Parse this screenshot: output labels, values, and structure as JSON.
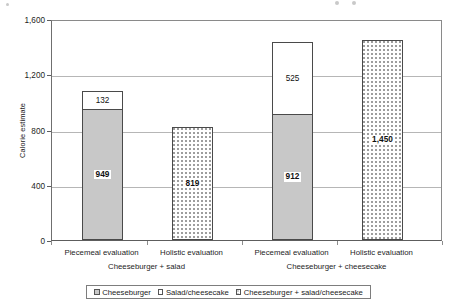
{
  "chart_data": {
    "type": "bar",
    "subtype": "stacked-bar",
    "title": "",
    "xlabel": "",
    "ylabel": "Calorie estimate",
    "ylim": [
      0,
      1600
    ],
    "yticks": [
      0,
      400,
      800,
      1200,
      1600
    ],
    "ytick_labels": [
      "0",
      "400",
      "800",
      "1,200",
      "1,600"
    ],
    "grid": "horizontal",
    "legend_position": "bottom",
    "categories": [
      "Piecemeal evaluation",
      "Holistic evaluation",
      "Piecemeal evaluation",
      "Holistic evaluation"
    ],
    "groups": [
      {
        "label": "Cheeseburger + salad",
        "categories": [
          "Piecemeal evaluation",
          "Holistic evaluation"
        ]
      },
      {
        "label": "Cheeseburger + cheesecake",
        "categories": [
          "Piecemeal evaluation",
          "Holistic evaluation"
        ]
      }
    ],
    "series": [
      {
        "name": "Cheeseburger",
        "fill": "gray",
        "values": [
          949,
          null,
          912,
          null
        ]
      },
      {
        "name": "Salad/cheesecake",
        "fill": "white",
        "values": [
          132,
          null,
          525,
          null
        ]
      },
      {
        "name": "Cheeseburger + salad/cheesecake",
        "fill": "dots",
        "values": [
          null,
          819,
          null,
          1450
        ]
      }
    ],
    "bars": [
      {
        "category": "Piecemeal evaluation",
        "group": "Cheeseburger + salad",
        "total": 1081,
        "segments": [
          {
            "series": "Cheeseburger",
            "value": 949,
            "label": "949",
            "fill": "gray",
            "label_style": "boxed"
          },
          {
            "series": "Salad/cheesecake",
            "value": 132,
            "label": "132",
            "fill": "white",
            "label_style": "plain"
          }
        ]
      },
      {
        "category": "Holistic evaluation",
        "group": "Cheeseburger + salad",
        "total": 819,
        "segments": [
          {
            "series": "Cheeseburger + salad/cheesecake",
            "value": 819,
            "label": "819",
            "fill": "dots",
            "label_style": "boxed"
          }
        ]
      },
      {
        "category": "Piecemeal evaluation",
        "group": "Cheeseburger + cheesecake",
        "total": 1437,
        "segments": [
          {
            "series": "Cheeseburger",
            "value": 912,
            "label": "912",
            "fill": "gray",
            "label_style": "boxed"
          },
          {
            "series": "Salad/cheesecake",
            "value": 525,
            "label": "525",
            "fill": "white",
            "label_style": "plain"
          }
        ]
      },
      {
        "category": "Holistic evaluation",
        "group": "Cheeseburger + cheesecake",
        "total": 1450,
        "segments": [
          {
            "series": "Cheeseburger + salad/cheesecake",
            "value": 1450,
            "label": "1,450",
            "fill": "dots",
            "label_style": "boxed"
          }
        ]
      }
    ],
    "legend": [
      {
        "label": "Cheeseburger",
        "fill": "gray"
      },
      {
        "label": "Salad/cheesecake",
        "fill": "white"
      },
      {
        "label": "Cheeseburger + salad/cheesecake",
        "fill": "dots"
      }
    ],
    "colors": {
      "series_cheeseburger": "#c8c8c8",
      "series_salad_cheesecake": "#ffffff",
      "series_combined": "#ffffff",
      "axis": "#5d5d5d",
      "gridline": "#b6b6b6",
      "text": "#1a1a1a"
    }
  }
}
